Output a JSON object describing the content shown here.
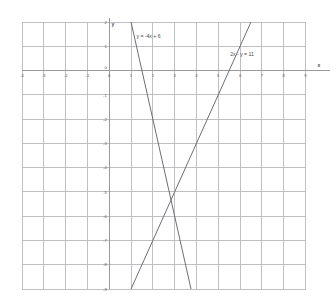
{
  "chart_data": {
    "type": "line",
    "title": "",
    "subtitle": "",
    "xlabel": "x",
    "ylabel": "y",
    "xlim": [
      -4,
      9
    ],
    "ylim": [
      -9,
      2
    ],
    "grid": true,
    "grid_spacing": 1,
    "legend_position": "inline-annotation",
    "xticks": [
      "-4",
      "-3",
      "-2",
      "-1",
      "0",
      "1",
      "2",
      "3",
      "4",
      "5",
      "6",
      "7",
      "8",
      "9"
    ],
    "xtick_values": [
      -4,
      -3,
      -2,
      -1,
      0,
      1,
      2,
      3,
      4,
      5,
      6,
      7,
      8,
      9
    ],
    "yticks": [
      "2",
      "1",
      "0",
      "-1",
      "-2",
      "-3",
      "-4",
      "-5",
      "-6",
      "-7",
      "-8",
      "-9"
    ],
    "ytick_values": [
      2,
      1,
      0,
      -1,
      -2,
      -3,
      -4,
      -5,
      -6,
      -7,
      -8,
      -9
    ],
    "series": [
      {
        "name": "y = -4x + 6",
        "equation": "y = -4x + 6",
        "slope": -4,
        "intercept": 6,
        "color": "#6e6e74",
        "label": "y = -4x + 6",
        "label_at": {
          "x": 1.25,
          "y": 1.35
        },
        "points": [
          {
            "x": 1.0,
            "y": 2.0
          },
          {
            "x": 3.75,
            "y": -9.0
          }
        ]
      },
      {
        "name": "2x - y = 11",
        "equation": "2x - y = 11",
        "slope": 2,
        "intercept": -11,
        "color": "#6e6e74",
        "label": "2x - y = 11",
        "label_at": {
          "x": 5.55,
          "y": 0.58
        },
        "points": [
          {
            "x": 6.5,
            "y": 2.0
          },
          {
            "x": 1.0,
            "y": -9.0
          }
        ]
      }
    ],
    "annotations": [
      {
        "text": "y = -4x + 6",
        "x": 1.25,
        "y": 1.35
      },
      {
        "text": "2x - y = 11",
        "x": 5.55,
        "y": 0.58
      }
    ],
    "intersection": {
      "x": 3.4,
      "y": -5.4
    }
  },
  "axes": {
    "x_axis_name": "x",
    "y_axis_name": "y",
    "origin_label": "0"
  },
  "colors": {
    "grid": "#b9b9bb",
    "axis": "#9a9a9d",
    "line": "#6e6e74",
    "text": "#5b5b60",
    "background": "#ffffff"
  }
}
